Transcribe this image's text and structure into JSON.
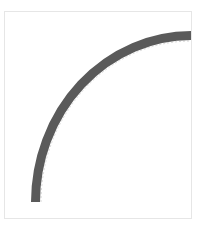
{
  "diagram": {
    "type": "quarter-arc",
    "frame": {
      "x": 4.5,
      "y": 11.5,
      "width": 187,
      "height": 207,
      "stroke": "#e6e6e6"
    },
    "arc": {
      "start": {
        "x": 35.5,
        "y": 202
      },
      "end": {
        "x": 191,
        "y": 35.5
      },
      "rx": 156,
      "ry": 167,
      "stroke_width": 9,
      "color": "#5a5a5a"
    },
    "guide": {
      "color": "#d8d8d8",
      "dash": "2 2"
    }
  }
}
